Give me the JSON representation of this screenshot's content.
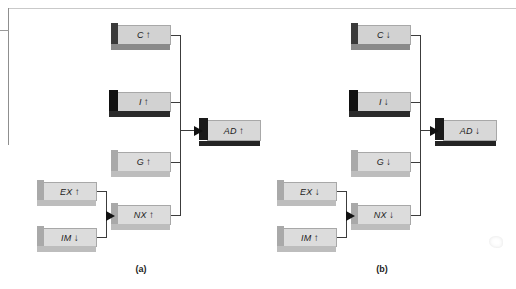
{
  "figure": {
    "type": "flow-diagram",
    "panels": [
      {
        "id": "a",
        "caption": "(a)",
        "components": [
          {
            "key": "c",
            "label": "C",
            "arrow": "↑"
          },
          {
            "key": "i",
            "label": "I",
            "arrow": "↑"
          },
          {
            "key": "g",
            "label": "G",
            "arrow": "↑"
          },
          {
            "key": "nx",
            "label": "NX",
            "arrow": "↑"
          }
        ],
        "inputs": [
          {
            "key": "ex",
            "label": "EX",
            "arrow": "↑"
          },
          {
            "key": "im",
            "label": "IM",
            "arrow": "↓"
          }
        ],
        "result": {
          "key": "ad",
          "label": "AD",
          "arrow": "↑"
        }
      },
      {
        "id": "b",
        "caption": "(b)",
        "components": [
          {
            "key": "c",
            "label": "C",
            "arrow": "↓"
          },
          {
            "key": "i",
            "label": "I",
            "arrow": "↓"
          },
          {
            "key": "g",
            "label": "G",
            "arrow": "↓"
          },
          {
            "key": "nx",
            "label": "NX",
            "arrow": "↓"
          }
        ],
        "inputs": [
          {
            "key": "ex",
            "label": "EX",
            "arrow": "↓"
          },
          {
            "key": "im",
            "label": "IM",
            "arrow": "↑"
          }
        ],
        "result": {
          "key": "ad",
          "label": "AD",
          "arrow": "↓"
        }
      }
    ]
  },
  "colors": {
    "box_fill": "#d2d2d2",
    "box_fill_light": "#dcdcdc",
    "shadow_dark": "#111111",
    "connector": "#3c3c3c",
    "text": "#1b1b1b",
    "background": "#ffffff"
  }
}
